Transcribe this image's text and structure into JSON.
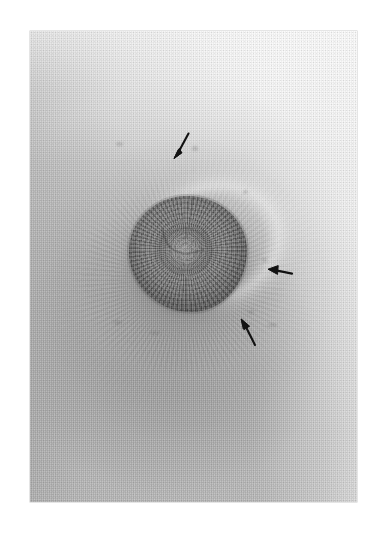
{
  "page": {
    "background_color": "#ffffff",
    "width": 385,
    "height": 541,
    "caption": ""
  },
  "figure": {
    "type": "clinical-photograph",
    "modality": "grayscale photographic print",
    "print": {
      "left": 30,
      "top": 31,
      "width": 327,
      "height": 471,
      "border_color": "#a0a0a0"
    },
    "tones": {
      "paper_white": "#ffffff",
      "print_highlight": "#f4f4f4",
      "print_midtone": "#c2c2c2",
      "print_shadow": "#8a8a8a",
      "nipple_dark": "#636363",
      "annotation_black": "#121212"
    },
    "regions": [
      {
        "name": "nipple",
        "center_x": 188,
        "center_y": 254,
        "radius": 59,
        "tone": "#6b6b6b"
      },
      {
        "name": "areola",
        "center_x": 183,
        "center_y": 280,
        "radius_x": 125,
        "radius_y": 116,
        "tone": "#9b9b9b"
      },
      {
        "name": "skin-striae",
        "center_x": 188,
        "center_y": 284,
        "radius": 150,
        "tone": "#aeaeae"
      },
      {
        "name": "lower-shadow",
        "center_x": 167,
        "center_y": 355,
        "tone": "#8d8d8d"
      }
    ],
    "annotations": [
      {
        "id": "arrow-superior",
        "label": "arrow-superior",
        "direction": "down-left",
        "tip_x": 174,
        "tip_y": 156,
        "tail_x": 186,
        "tail_y": 138,
        "color": "#121212"
      },
      {
        "id": "arrow-lateral",
        "label": "arrow-lateral",
        "direction": "left",
        "tip_x": 269,
        "tip_y": 270,
        "tail_x": 289,
        "tail_y": 275,
        "color": "#121212"
      },
      {
        "id": "arrow-inferolateral",
        "label": "arrow-inferolateral",
        "direction": "up-left",
        "tip_x": 241,
        "tip_y": 321,
        "tail_x": 254,
        "tail_y": 340,
        "color": "#121212"
      }
    ],
    "specks": [
      {
        "x": 116,
        "y": 142,
        "w": 7,
        "h": 4
      },
      {
        "x": 192,
        "y": 146,
        "w": 6,
        "h": 5
      },
      {
        "x": 114,
        "y": 320,
        "w": 8,
        "h": 5
      },
      {
        "x": 243,
        "y": 190,
        "w": 5,
        "h": 4
      },
      {
        "x": 248,
        "y": 310,
        "w": 6,
        "h": 4
      },
      {
        "x": 262,
        "y": 258,
        "w": 5,
        "h": 4
      }
    ]
  }
}
